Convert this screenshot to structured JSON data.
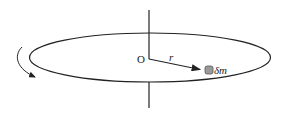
{
  "diagram": {
    "labels": {
      "origin": "O",
      "radius": "r",
      "mass_element": "δm"
    },
    "colors": {
      "stroke": "#222222",
      "mass_fill": "#9a9a9a",
      "background": "#ffffff"
    }
  }
}
